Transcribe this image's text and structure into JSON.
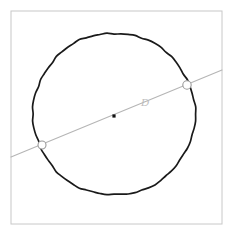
{
  "figure": {
    "type": "geometry-diagram",
    "canvas": {
      "width": 238,
      "height": 236,
      "background": "#ffffff"
    },
    "frame": {
      "name": "figure-border",
      "x": 11,
      "y": 11,
      "width": 211,
      "height": 213,
      "stroke": "#c8c8c8",
      "stroke_width": 1,
      "fill": "#ffffff"
    },
    "circle": {
      "name": "main-circle",
      "center_x": 114,
      "center_y": 114,
      "radius": 81,
      "stroke": "#1a1a1a",
      "stroke_width": 1.7,
      "fill": "none"
    },
    "center_point": {
      "name": "circle-center-point",
      "x": 114,
      "y": 116,
      "size": 3.2,
      "fill": "#111111",
      "shape": "square"
    },
    "secant": {
      "name": "secant-line",
      "x1": 11,
      "y1": 157,
      "x2": 222,
      "y2": 70,
      "stroke": "#b5b5b5",
      "stroke_width": 1.1
    },
    "intersections": [
      {
        "name": "intersection-point-left",
        "x": 42,
        "y": 145,
        "radius": 4.0,
        "stroke": "#9a9a9a",
        "stroke_width": 1.1,
        "fill": "#ffffff"
      },
      {
        "name": "intersection-point-right",
        "x": 187,
        "y": 85,
        "radius": 4.2,
        "stroke": "#9a9a9a",
        "stroke_width": 1.1,
        "fill": "#ffffff"
      }
    ],
    "labels": [
      {
        "name": "label-D",
        "text": "D",
        "x": 145,
        "y": 106,
        "font_size": 11,
        "color": "#bdbdbd",
        "italic": true
      }
    ]
  }
}
